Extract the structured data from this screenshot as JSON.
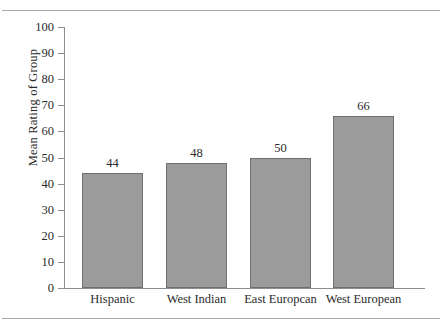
{
  "figure": {
    "rule_top": "horizontal-rule",
    "rule_bottom": "horizontal-rule"
  },
  "chart_data": {
    "type": "bar",
    "title": "",
    "xlabel": "",
    "ylabel": "Mean Rating of Group",
    "categories": [
      "Hispanic",
      "West Indian",
      "East Europcan",
      "West European"
    ],
    "values": [
      44,
      48,
      50,
      66
    ],
    "value_labels": [
      "44",
      "48",
      "50",
      "66"
    ],
    "ylim": [
      0,
      100
    ],
    "yticks": [
      0,
      10,
      20,
      30,
      40,
      50,
      60,
      70,
      80,
      90,
      100
    ],
    "ytick_labels": [
      "0",
      "10",
      "20",
      "30",
      "40",
      "50",
      "60",
      "70",
      "80",
      "90",
      "100"
    ],
    "grid": false,
    "legend": null,
    "bar_color": "#9b9b9b",
    "bar_border_color": "#6f6f6f",
    "axis_color": "#8e8e8e"
  }
}
